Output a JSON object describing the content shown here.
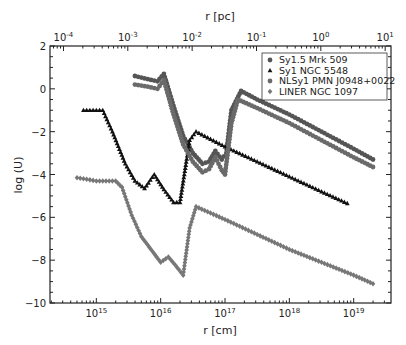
{
  "chart_data": {
    "type": "line",
    "title": "",
    "xlabel": "r [cm]",
    "ylabel": "log (U)",
    "x2label": "r [pc]",
    "xscale": "log",
    "xlim_log10": [
      14.28,
      19.58
    ],
    "ylim": [
      -10,
      2
    ],
    "xticks": [
      "10^15",
      "10^16",
      "10^17",
      "10^18",
      "10^19"
    ],
    "xticks_log10": [
      15,
      16,
      17,
      18,
      19
    ],
    "x2ticks": [
      "10^-4",
      "10^-3",
      "10^-2",
      "10^-1",
      "10^0",
      "10^1"
    ],
    "yticks": [
      2,
      0,
      -2,
      -4,
      -6,
      -8,
      -10
    ],
    "grid": false,
    "legend_position": "upper right",
    "series": [
      {
        "name": "Sy1.5 Mrk 509",
        "marker": "circle",
        "color": "#555555",
        "points": [
          [
            15.6,
            0.6
          ],
          [
            15.8,
            0.45
          ],
          [
            15.95,
            0.35
          ],
          [
            16.05,
            0.7
          ],
          [
            16.2,
            -0.8
          ],
          [
            16.35,
            -2.2
          ],
          [
            16.5,
            -3.0
          ],
          [
            16.65,
            -3.5
          ],
          [
            16.75,
            -3.4
          ],
          [
            16.85,
            -2.9
          ],
          [
            16.95,
            -3.3
          ],
          [
            17.02,
            -3.0
          ],
          [
            17.1,
            -1.0
          ],
          [
            17.25,
            -0.1
          ],
          [
            17.5,
            -0.5
          ],
          [
            18.0,
            -1.2
          ],
          [
            18.5,
            -2.0
          ],
          [
            19.0,
            -2.8
          ],
          [
            19.3,
            -3.3
          ]
        ]
      },
      {
        "name": "Sy1 NGC 5548",
        "marker": "triangle",
        "color": "#111111",
        "points": [
          [
            14.8,
            -1.0
          ],
          [
            15.1,
            -1.0
          ],
          [
            15.25,
            -2.0
          ],
          [
            15.45,
            -3.5
          ],
          [
            15.6,
            -4.3
          ],
          [
            15.75,
            -4.65
          ],
          [
            15.9,
            -4.0
          ],
          [
            16.05,
            -4.7
          ],
          [
            16.2,
            -5.3
          ],
          [
            16.3,
            -5.3
          ],
          [
            16.45,
            -2.4
          ],
          [
            16.55,
            -2.0
          ],
          [
            17.0,
            -2.7
          ],
          [
            17.5,
            -3.4
          ],
          [
            18.0,
            -4.1
          ],
          [
            18.5,
            -4.8
          ],
          [
            18.9,
            -5.35
          ]
        ]
      },
      {
        "name": "NLSy1 PMN J0948+0022",
        "marker": "circle",
        "color": "#6a6a6a",
        "points": [
          [
            15.6,
            0.2
          ],
          [
            15.8,
            0.1
          ],
          [
            15.95,
            0.0
          ],
          [
            16.05,
            0.4
          ],
          [
            16.2,
            -1.2
          ],
          [
            16.35,
            -2.6
          ],
          [
            16.5,
            -3.4
          ],
          [
            16.65,
            -3.9
          ],
          [
            16.75,
            -3.75
          ],
          [
            16.85,
            -3.2
          ],
          [
            16.95,
            -3.8
          ],
          [
            17.0,
            -4.0
          ],
          [
            17.1,
            -1.6
          ],
          [
            17.2,
            -0.5
          ],
          [
            17.5,
            -0.9
          ],
          [
            18.0,
            -1.6
          ],
          [
            18.5,
            -2.4
          ],
          [
            19.0,
            -3.2
          ],
          [
            19.3,
            -3.65
          ]
        ]
      },
      {
        "name": "LINER NGC 1097",
        "marker": "diamond",
        "color": "#777777",
        "points": [
          [
            14.7,
            -4.15
          ],
          [
            15.0,
            -4.3
          ],
          [
            15.3,
            -4.3
          ],
          [
            15.4,
            -4.6
          ],
          [
            15.55,
            -5.9
          ],
          [
            15.7,
            -6.9
          ],
          [
            15.85,
            -7.5
          ],
          [
            16.0,
            -8.1
          ],
          [
            16.12,
            -7.85
          ],
          [
            16.22,
            -8.2
          ],
          [
            16.35,
            -8.7
          ],
          [
            16.45,
            -6.5
          ],
          [
            16.55,
            -5.5
          ],
          [
            17.0,
            -6.1
          ],
          [
            17.5,
            -6.8
          ],
          [
            18.0,
            -7.5
          ],
          [
            18.5,
            -8.1
          ],
          [
            19.0,
            -8.7
          ],
          [
            19.3,
            -9.1
          ]
        ]
      }
    ]
  }
}
